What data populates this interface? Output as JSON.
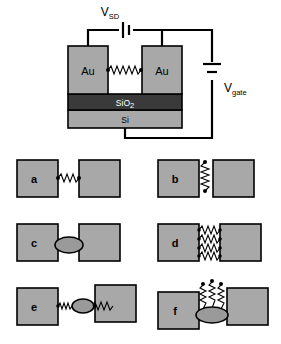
{
  "figure": {
    "colors": {
      "electrode_gold": "#a8a8a8",
      "oxide_dark": "#3a3a3a",
      "silicon_gray": "#a8a8a8",
      "particle_gray": "#9a9a9a",
      "outline": "#000000",
      "background": "#ffffff",
      "label_on_dark": "#ffffff"
    },
    "device": {
      "source_label": "Au",
      "drain_label": "Au",
      "oxide_label": "SiO",
      "oxide_label_sub": "2",
      "substrate_label": "Si",
      "bias_label": "V",
      "bias_label_sub": "SD",
      "gate_label": "V",
      "gate_label_sub": "gate"
    },
    "panels": [
      {
        "id": "a",
        "label": "a",
        "description": "single molecule bridging both electrodes",
        "gap": "narrow",
        "molecules": 1,
        "molecule_orientation": "horizontal",
        "bridged": true,
        "nanoparticle": false
      },
      {
        "id": "b",
        "label": "b",
        "description": "molecule attached vertically, not bridging the gap",
        "gap": "narrow",
        "molecules": 1,
        "molecule_orientation": "vertical",
        "bridged": false,
        "nanoparticle": false
      },
      {
        "id": "c",
        "label": "c",
        "description": "metal nanoparticle in the gap without molecules",
        "gap": "narrow",
        "molecules": 0,
        "molecule_orientation": "none",
        "bridged": false,
        "nanoparticle": true
      },
      {
        "id": "d",
        "label": "d",
        "description": "multiple molecules bridging both electrodes in parallel",
        "gap": "narrow",
        "molecules": 4,
        "molecule_orientation": "horizontal",
        "bridged": true,
        "nanoparticle": false
      },
      {
        "id": "e",
        "label": "e",
        "description": "molecule-nanoparticle-molecule chain bridging a wide gap",
        "gap": "wide",
        "molecules": 2,
        "molecule_orientation": "horizontal",
        "bridged": true,
        "nanoparticle": true
      },
      {
        "id": "f",
        "label": "f",
        "description": "nanoparticle in the gap with unbound molecules on top",
        "gap": "wide",
        "molecules": 3,
        "molecule_orientation": "vertical",
        "bridged": false,
        "nanoparticle": true
      }
    ]
  }
}
